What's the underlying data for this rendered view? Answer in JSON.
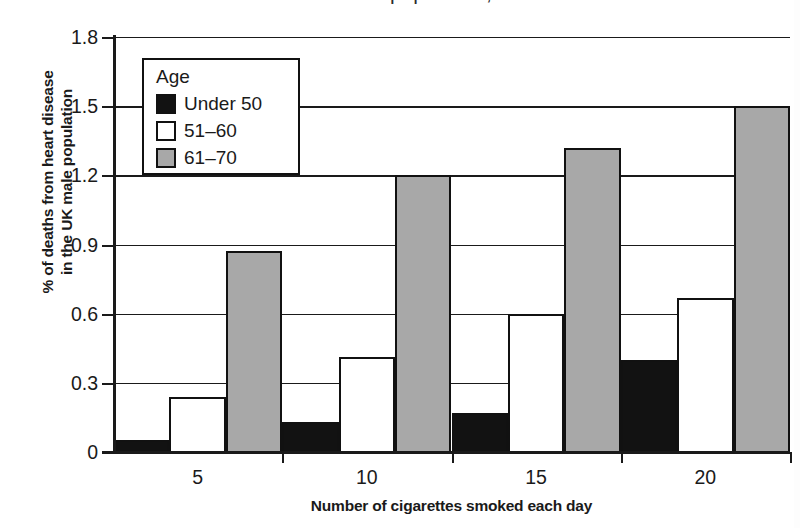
{
  "caption": {
    "partial_text": "deaths from heart disease in the male UK population, at differe"
  },
  "chart_data": {
    "type": "bar",
    "title": "",
    "subtitle": "",
    "xlabel": "Number of cigarettes smoked each day",
    "ylabel": "% of deaths from heart disease\nin the UK male population",
    "ylabel_line1": "% of deaths from heart disease",
    "ylabel_line2": "in the UK male population",
    "categories": [
      "5",
      "10",
      "15",
      "20"
    ],
    "series": [
      {
        "name": "Under 50",
        "color": "#121212",
        "values": [
          0.05,
          0.13,
          0.17,
          0.4
        ]
      },
      {
        "name": "51–60",
        "color": "#ffffff",
        "values": [
          0.24,
          0.41,
          0.6,
          0.67
        ]
      },
      {
        "name": "61–70",
        "color": "#a8a8a8",
        "values": [
          0.87,
          1.2,
          1.32,
          1.5
        ]
      }
    ],
    "ylim": [
      0,
      1.8
    ],
    "yticks": [
      0,
      0.3,
      0.6,
      0.9,
      1.2,
      1.5,
      1.8
    ],
    "ytick_labels": [
      "0",
      "0.3",
      "0.6",
      "0.9",
      "1.2",
      "1.5",
      "1.8"
    ],
    "xtick_labels": [
      "5",
      "10",
      "15",
      "20"
    ],
    "grid": "horizontal",
    "legend": {
      "title": "Age",
      "position": "top-left-inside",
      "entries": [
        "Under 50",
        "51–60",
        "61–70"
      ]
    }
  }
}
